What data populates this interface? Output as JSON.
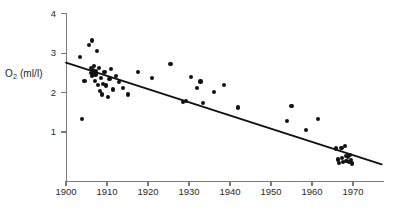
{
  "chart_data": {
    "type": "scatter",
    "title": "",
    "xlabel": "",
    "ylabel": "O2 (ml/l)",
    "ylabel_base": "O",
    "ylabel_sub": "2",
    "ylabel_unit": " (ml/l)",
    "xlim": [
      1898,
      1977
    ],
    "ylim": [
      0,
      4
    ],
    "x_ticks": [
      1900,
      1910,
      1920,
      1930,
      1940,
      1950,
      1960,
      1970
    ],
    "x_tick_labels": [
      "1900",
      "1910",
      "1920",
      "1930",
      "1940",
      "1950",
      "1960",
      "1970"
    ],
    "y_ticks": [
      1,
      2,
      3,
      4
    ],
    "y_tick_labels": [
      "1",
      "2",
      "3",
      "4"
    ],
    "grid": false,
    "legend": "none",
    "marker_color": "#111111",
    "axis_color": "#7b7b7b",
    "trendline_color": "#111111",
    "points": [
      [
        1903.5,
        2.9
      ],
      [
        1904.0,
        1.32
      ],
      [
        1904.5,
        2.3
      ],
      [
        1905.6,
        3.2
      ],
      [
        1906.3,
        3.32
      ],
      [
        1906.0,
        2.62
      ],
      [
        1906.2,
        2.5
      ],
      [
        1906.4,
        2.42
      ],
      [
        1906.6,
        2.58
      ],
      [
        1906.8,
        2.68
      ],
      [
        1907.0,
        2.3
      ],
      [
        1907.2,
        2.46
      ],
      [
        1907.4,
        2.55
      ],
      [
        1907.5,
        3.05
      ],
      [
        1907.8,
        2.2
      ],
      [
        1908.0,
        2.62
      ],
      [
        1908.3,
        2.05
      ],
      [
        1908.6,
        2.38
      ],
      [
        1908.8,
        1.95
      ],
      [
        1909.1,
        2.22
      ],
      [
        1909.4,
        2.52
      ],
      [
        1909.8,
        2.18
      ],
      [
        1910.2,
        1.88
      ],
      [
        1910.6,
        2.34
      ],
      [
        1911.0,
        2.6
      ],
      [
        1911.5,
        2.08
      ],
      [
        1912.2,
        2.42
      ],
      [
        1913.0,
        2.26
      ],
      [
        1914.0,
        2.12
      ],
      [
        1915.2,
        1.95
      ],
      [
        1917.5,
        2.52
      ],
      [
        1921.0,
        2.38
      ],
      [
        1925.5,
        2.72
      ],
      [
        1928.5,
        1.76
      ],
      [
        1929.2,
        1.78
      ],
      [
        1930.5,
        2.4
      ],
      [
        1932.0,
        2.12
      ],
      [
        1932.8,
        2.28
      ],
      [
        1933.5,
        1.74
      ],
      [
        1936.0,
        2.02
      ],
      [
        1938.5,
        2.2
      ],
      [
        1942.0,
        1.62
      ],
      [
        1954.0,
        1.28
      ],
      [
        1955.0,
        1.65
      ],
      [
        1958.5,
        1.05
      ],
      [
        1961.5,
        1.32
      ],
      [
        1965.8,
        0.58
      ],
      [
        1966.4,
        0.3
      ],
      [
        1966.6,
        0.22
      ],
      [
        1967.2,
        0.6
      ],
      [
        1967.4,
        0.34
      ],
      [
        1967.6,
        0.24
      ],
      [
        1968.0,
        0.64
      ],
      [
        1968.2,
        0.4
      ],
      [
        1968.4,
        0.26
      ],
      [
        1968.8,
        0.38
      ],
      [
        1969.0,
        0.24
      ],
      [
        1969.3,
        0.42
      ],
      [
        1969.5,
        0.28
      ],
      [
        1969.8,
        0.2
      ]
    ],
    "trendline": {
      "x0": 1900,
      "y0": 2.76,
      "x1": 1977,
      "y1": 0.18
    }
  }
}
